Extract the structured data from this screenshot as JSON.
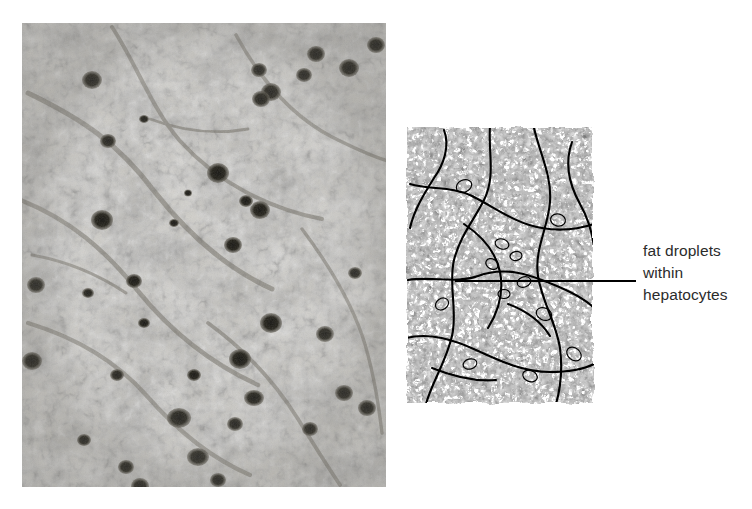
{
  "figure": {
    "name": "liver-histology-fatty-change",
    "panels": [
      {
        "id": "photomicrograph",
        "kind": "photomicrograph",
        "description": "grayscale light-microscope section of liver showing vacuolated hepatocytes and dark-stained nuclei",
        "x": 22,
        "y": 23,
        "width": 364,
        "height": 464
      },
      {
        "id": "line-drawing",
        "kind": "line-drawing",
        "description": "black and white interpretive line drawing of the same liver field outlining fat droplets inside hepatocytes",
        "x": 404,
        "y": 124,
        "width": 192,
        "height": 282
      }
    ]
  },
  "annotation": {
    "leader_line": {
      "x1": 455,
      "y1": 281,
      "x2": 636,
      "y2": 281,
      "color": "#000000"
    },
    "label_lines": [
      "fat droplets",
      "within",
      "hepatocytes"
    ],
    "label_text": "fat droplets within hepatocytes",
    "text_color": "#2b2b2b"
  },
  "colors": {
    "background": "#ffffff",
    "ink": "#000000",
    "photo_mid_gray": "#b9b7b2",
    "photo_light_gray": "#e3e1dc",
    "photo_dark_gray": "#3a3833",
    "nucleus_dark": "#1d1b18"
  }
}
